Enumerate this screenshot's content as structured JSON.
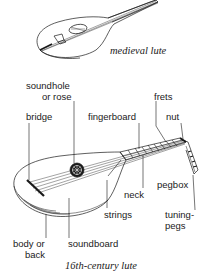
{
  "figure": {
    "captions": {
      "medieval": "medieval lute",
      "renaissance": "16th-century lute"
    },
    "labels": {
      "soundhole": "soundhole",
      "or_rose": "or rose",
      "frets": "frets",
      "bridge": "bridge",
      "fingerboard": "fingerboard",
      "nut": "nut",
      "neck": "neck",
      "pegbox": "pegbox",
      "strings": "strings",
      "tuning": "tuning-",
      "pegs": "pegs",
      "body_or": "body or",
      "back": "back",
      "soundboard": "soundboard"
    },
    "colors": {
      "ink": "#1a1a1a",
      "background": "#ffffff"
    }
  }
}
